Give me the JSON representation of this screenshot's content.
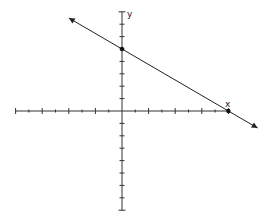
{
  "chart_data": {
    "type": "line",
    "title": "",
    "xlabel": "x",
    "ylabel": "y",
    "xlim": [
      -8,
      8
    ],
    "ylim": [
      -8,
      8
    ],
    "x_tick_step": 1,
    "y_tick_step": 1,
    "grid": false,
    "tick_labels": false,
    "series": [
      {
        "name": "line",
        "equation": "y = -5/8 x + 5",
        "slope": -0.625,
        "intercept": 5,
        "points": [
          {
            "x": 0,
            "y": 5,
            "label": "y-intercept"
          },
          {
            "x": 8,
            "y": 0,
            "label": "x-intercept"
          }
        ],
        "arrows": "both ends",
        "extends_x": [
          -4,
          10.2
        ]
      }
    ]
  },
  "labels": {
    "x_axis": "x",
    "y_axis": "y"
  },
  "colors": {
    "axis": "#333333",
    "line": "#222222",
    "point": "#111111"
  }
}
